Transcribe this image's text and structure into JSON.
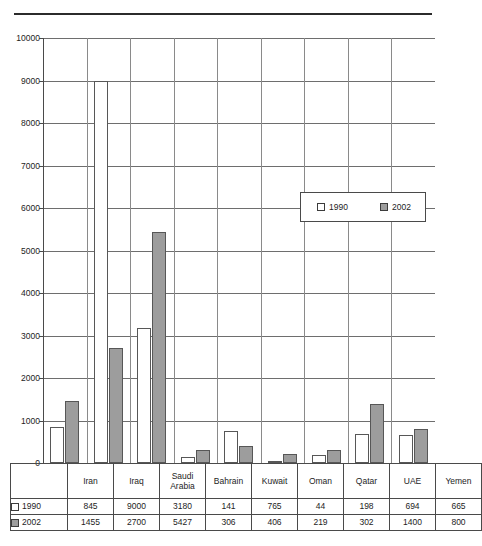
{
  "chart_data": {
    "type": "bar",
    "title": "",
    "xlabel": "",
    "ylabel": "",
    "ylim": [
      0,
      10000
    ],
    "ytick_step": 1000,
    "grid": true,
    "legend_position": "inside-right",
    "categories": [
      "Iran",
      "Iraq",
      "Saudi Arabia",
      "Bahrain",
      "Kuwait",
      "Oman",
      "Qatar",
      "UAE",
      "Yemen"
    ],
    "series": [
      {
        "name": "1990",
        "color": "#ffffff",
        "values": [
          845,
          9000,
          3180,
          141,
          765,
          44,
          198,
          694,
          665
        ]
      },
      {
        "name": "2002",
        "color": "#9d9d9d",
        "values": [
          1455,
          2700,
          5427,
          306,
          406,
          219,
          302,
          1400,
          800
        ]
      }
    ],
    "ytick_labels": [
      "10000",
      "9000",
      "8000",
      "7000",
      "6000",
      "5000",
      "4000",
      "3000",
      "2000",
      "1000",
      "0"
    ]
  },
  "legend": {
    "items": [
      {
        "label": "1990",
        "swatch": "white-square-icon"
      },
      {
        "label": "2002",
        "swatch": "gray-square-icon"
      }
    ]
  },
  "table": {
    "header_blank": "",
    "columns": [
      "Iran",
      "Iraq",
      "Saudi Arabia",
      "Bahrain",
      "Kuwait",
      "Oman",
      "Qatar",
      "UAE",
      "Yemen"
    ],
    "rows": [
      {
        "label": "1990",
        "swatch": "white-square-icon",
        "values": [
          "845",
          "9000",
          "3180",
          "141",
          "765",
          "44",
          "198",
          "694",
          "665"
        ]
      },
      {
        "label": "2002",
        "swatch": "gray-square-icon",
        "values": [
          "1455",
          "2700",
          "5427",
          "306",
          "406",
          "219",
          "302",
          "1400",
          "800"
        ]
      }
    ]
  }
}
